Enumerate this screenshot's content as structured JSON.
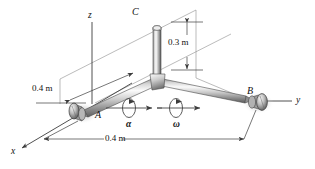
{
  "figure": {
    "kind": "engineering-mechanics-diagram",
    "background_color": "#ffffff",
    "rod_color_light": "#f2f2f2",
    "rod_color_mid": "#b8b8b8",
    "rod_color_dark": "#6e6e6e",
    "line_color": "#3c3c3c",
    "label_color": "#111111"
  },
  "axes": [
    {
      "id": "z",
      "label": "z",
      "x": 90,
      "y": 16
    },
    {
      "id": "y",
      "label": "y",
      "x": 298,
      "y": 101
    },
    {
      "id": "x",
      "label": "x",
      "x": 13,
      "y": 152
    }
  ],
  "points": [
    {
      "id": "A",
      "label": "A",
      "x": 95,
      "y": 114
    },
    {
      "id": "B",
      "label": "B",
      "x": 249,
      "y": 94
    },
    {
      "id": "C",
      "label": "C",
      "x": 134,
      "y": 12
    }
  ],
  "dimensions": [
    {
      "id": "dim-vertical-c",
      "label": "0.3 m",
      "x": 178,
      "y": 42,
      "measures": "height of vertical arm at C"
    },
    {
      "id": "dim-left-a",
      "label": "0.4 m",
      "x": 34,
      "y": 88,
      "measures": "distance from bearing A to hub"
    },
    {
      "id": "dim-bottom",
      "label": "0.4 m",
      "x": 112,
      "y": 144,
      "measures": "distance from hub to bearing B"
    }
  ],
  "motion_symbols": [
    {
      "id": "alpha",
      "label": "α",
      "x": 129,
      "y": 124,
      "meaning": "angular acceleration"
    },
    {
      "id": "omega",
      "label": "ω",
      "x": 176,
      "y": 124,
      "meaning": "angular velocity"
    }
  ]
}
